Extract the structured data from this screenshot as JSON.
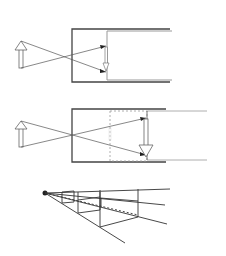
{
  "figure": {
    "title": "",
    "panels": [
      {
        "id": "pinhole-camera",
        "description": "Pinhole camera: upright object arrow, rays crossing at pinhole, inverted image on film plane",
        "object_arrow": "up",
        "image_arrow": "down",
        "image_size": "small"
      },
      {
        "id": "pinhole-camera-extended",
        "description": "Pinhole camera with longer box; dashed previous film plane, larger inverted image on farther plane",
        "object_arrow": "up",
        "image_arrow": "down",
        "image_size": "large"
      },
      {
        "id": "perspective-frustum",
        "description": "Perspective projection from a single viewpoint with nested rectangular frames receding to the eye point"
      }
    ],
    "colors": {
      "stroke": "#333333",
      "light_stroke": "#888888",
      "background": "#ffffff"
    }
  }
}
